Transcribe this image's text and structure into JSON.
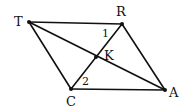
{
  "diagram": {
    "type": "geometry",
    "shape": "parallelogram TRAC with diagonals",
    "points": {
      "T": {
        "label": "T",
        "x": 29,
        "y": 22
      },
      "R": {
        "label": "R",
        "x": 122,
        "y": 24
      },
      "A": {
        "label": "A",
        "x": 165,
        "y": 90
      },
      "C": {
        "label": "C",
        "x": 71,
        "y": 89
      },
      "K": {
        "label": "K",
        "x": 96,
        "y": 57
      }
    },
    "segments": [
      [
        "T",
        "R"
      ],
      [
        "R",
        "A"
      ],
      [
        "A",
        "C"
      ],
      [
        "C",
        "T"
      ],
      [
        "T",
        "A"
      ],
      [
        "R",
        "C"
      ]
    ],
    "angles": [
      {
        "label": "1",
        "at": "R"
      },
      {
        "label": "2",
        "at": "C"
      }
    ],
    "stroke_color": "#111111"
  }
}
